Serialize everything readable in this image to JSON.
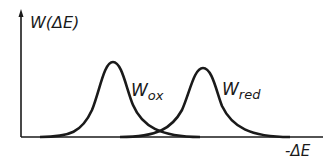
{
  "diagram": {
    "y_axis_label": "W(ΔE)",
    "x_axis_label": "-ΔE",
    "curves": [
      {
        "name": "W",
        "subscript": "ox",
        "peak_x": 113,
        "peak_y": 62
      },
      {
        "name": "W",
        "subscript": "red",
        "peak_x": 203,
        "peak_y": 67
      }
    ],
    "colors": {
      "line": "#1a1a1a",
      "background": "#ffffff"
    }
  }
}
